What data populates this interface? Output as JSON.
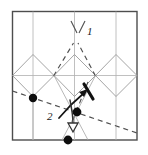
{
  "figure": {
    "labels": [
      {
        "id": "step-1",
        "text": "1",
        "x": 87,
        "y": 26
      },
      {
        "id": "step-2",
        "text": "2",
        "x": 47,
        "y": 111
      }
    ],
    "colors": {
      "frame": "#4d4d4d",
      "grid": "#a8a8a8",
      "diamond": "#9a9a9a",
      "dashed": "#555555",
      "solid_arrow": "#111111",
      "hollow_arrow": "#333333",
      "vertex_dot": "#0d0d0d",
      "background": "#ffffff"
    },
    "frame": {
      "x": 12,
      "y": 11,
      "width": 125,
      "height": 129
    },
    "grid": {
      "vertical_lines_x": [
        33,
        74.5,
        116
      ],
      "horizontal_lines_y": [
        75.5
      ]
    },
    "diamonds": [
      {
        "id": "diamond-left",
        "cx": 33,
        "cy": 75.5,
        "rx": 21,
        "ry": 21
      },
      {
        "id": "diamond-center",
        "cx": 74.5,
        "cy": 75.5,
        "rx": 21,
        "ry": 21
      },
      {
        "id": "diamond-right",
        "cx": 116,
        "cy": 75.5,
        "rx": 21,
        "ry": 21
      }
    ],
    "vertex_dots": [
      {
        "id": "dot-left",
        "x": 33,
        "y": 98,
        "r": 4
      },
      {
        "id": "dot-center",
        "x": 77,
        "y": 112,
        "r": 4.2
      },
      {
        "id": "dot-bottom",
        "x": 68,
        "y": 140,
        "r": 4.2
      }
    ],
    "arrows": [
      {
        "id": "arrow-fold-up",
        "style": "solid",
        "from_x": 62,
        "from_y": 116,
        "to_x": 87,
        "to_y": 89
      },
      {
        "id": "arrow-fold-down",
        "style": "hollow",
        "from_x": 70,
        "from_y": 100,
        "to_x": 73,
        "to_y": 129
      }
    ],
    "dashed_lines": [
      {
        "id": "crease-v-left",
        "x1": 74,
        "y1": 44,
        "x2": 54,
        "y2": 75.5
      },
      {
        "id": "crease-v-right",
        "x1": 78,
        "y1": 44,
        "x2": 96,
        "y2": 75.5
      },
      {
        "id": "crease-top-left-tick",
        "x1": 70,
        "y1": 22,
        "x2": 76,
        "y2": 34
      },
      {
        "id": "crease-top-right-tick",
        "x1": 85,
        "y1": 22,
        "x2": 79,
        "y2": 34
      },
      {
        "id": "crease-diagonal-long",
        "x1": 12,
        "y1": 92,
        "x2": 137,
        "y2": 133
      },
      {
        "id": "crease-mid-down",
        "x1": 88,
        "y1": 82,
        "x2": 73,
        "y2": 120
      }
    ]
  }
}
